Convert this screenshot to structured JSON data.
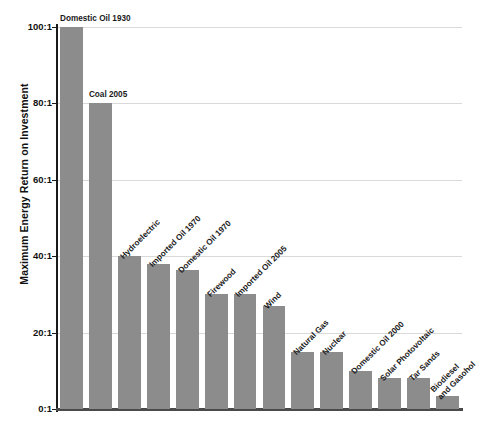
{
  "chart_data": {
    "type": "bar",
    "title": "",
    "xlabel": "",
    "ylabel": "Maximum Energy Return on Investment",
    "ylim": [
      0,
      100
    ],
    "grid": true,
    "legend": "none",
    "bar_color": "#8c8c8c",
    "ytick_labels": [
      "100:1",
      "80:1",
      "60:1",
      "40:1",
      "20:1",
      "0:1"
    ],
    "ytick_values": [
      100,
      80,
      60,
      40,
      20,
      0
    ],
    "categories": [
      "Domestic Oil 1930",
      "Coal 2005",
      "Hydroelectric",
      "Imported Oil 1970",
      "Domestic Oil 1970",
      "Firewood",
      "Imported Oil 2005",
      "Wind",
      "Natural Gas",
      "Nuclear",
      "Domestic Oil 2000",
      "Solar Photovoltaic",
      "Tar Sands",
      "Biodiesel and Gasohol"
    ],
    "values": [
      100,
      80,
      40,
      38,
      36.5,
      30,
      30,
      27,
      15,
      15,
      10,
      8,
      8,
      3.5
    ],
    "label_orientation": [
      "horizontal",
      "horizontal",
      "rotated",
      "rotated",
      "rotated",
      "rotated",
      "rotated",
      "rotated",
      "rotated",
      "rotated",
      "rotated",
      "rotated",
      "rotated",
      "rotated"
    ],
    "label_lines": [
      [
        "Domestic Oil 1930"
      ],
      [
        "Coal 2005"
      ],
      [
        "Hydroelectric"
      ],
      [
        "Imported Oil 1970"
      ],
      [
        "Domestic Oil 1970"
      ],
      [
        "Firewood"
      ],
      [
        "Imported Oil 2005"
      ],
      [
        "Wind"
      ],
      [
        "Natural Gas"
      ],
      [
        "Nuclear"
      ],
      [
        "Domestic Oil 2000"
      ],
      [
        "Solar Photovoltaic"
      ],
      [
        "Tar Sands"
      ],
      [
        "Biodiesel",
        "and Gasohol"
      ]
    ]
  }
}
